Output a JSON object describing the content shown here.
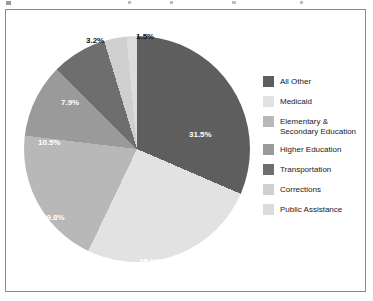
{
  "chart_data": {
    "type": "pie",
    "title": "",
    "subtitle": "",
    "xlabel": "",
    "ylabel": "",
    "legend_position": "right",
    "grid": false,
    "start_angle_deg": 0,
    "direction": "clockwise",
    "categories": [
      "All Other",
      "Medicaid",
      "Elementary & Secondary Education",
      "Higher Education",
      "Transportation",
      "Corrections",
      "Public Assistance"
    ],
    "values": [
      31.5,
      25.6,
      19.8,
      10.5,
      7.9,
      3.2,
      1.5
    ],
    "value_labels": [
      "31.5%",
      "25.6%",
      "19.8%",
      "10.5%",
      "7.9%",
      "3.2%",
      "1.5%"
    ],
    "units": "percent",
    "colors": [
      "#5e5e5e",
      "#e2e2e2",
      "#b8b8b8",
      "#9a9a9a",
      "#6e6e6e",
      "#cfcfcf",
      "#dcdcdc"
    ],
    "slices": [
      {
        "label": "All Other",
        "value": 31.5,
        "display": "31.5%",
        "color": "#5e5e5e",
        "label_color": "white"
      },
      {
        "label": "Medicaid",
        "value": 25.6,
        "display": "25.6%",
        "color": "#e2e2e2",
        "label_color": "white"
      },
      {
        "label": "Elementary & Secondary Education",
        "value": 19.8,
        "display": "19.8%",
        "color": "#b8b8b8",
        "label_color": "white"
      },
      {
        "label": "Higher Education",
        "value": 10.5,
        "display": "10.5%",
        "color": "#9a9a9a",
        "label_color": "white"
      },
      {
        "label": "Transportation",
        "value": 7.9,
        "display": "7.9%",
        "color": "#6e6e6e",
        "label_color": "white"
      },
      {
        "label": "Corrections",
        "value": 3.2,
        "display": "3.2%",
        "color": "#cfcfcf",
        "label_color": "black"
      },
      {
        "label": "Public Assistance",
        "value": 1.5,
        "display": "1.5%",
        "color": "#dcdcdc",
        "label_color": "black"
      }
    ]
  },
  "legend": {
    "items": [
      {
        "label": "All Other",
        "line1": "All Other",
        "line2": "",
        "color": "#5e5e5e"
      },
      {
        "label": "Medicaid",
        "line1": "Medicaid",
        "line2": "",
        "color": "#e2e2e2"
      },
      {
        "label": "Elementary & Secondary Education",
        "line1": "Elementary &",
        "line2": "Secondary Education",
        "color": "#b8b8b8"
      },
      {
        "label": "Higher Education",
        "line1": "Higher Education",
        "line2": "",
        "color": "#9a9a9a"
      },
      {
        "label": "Transportation",
        "line1": "Transportation",
        "line2": "",
        "color": "#6e6e6e"
      },
      {
        "label": "Corrections",
        "line1": "Corrections",
        "line2": "",
        "color": "#cfcfcf"
      },
      {
        "label": "Public Assistance",
        "line1": "Public Assistance",
        "line2": "",
        "color": "#dcdcdc"
      }
    ]
  }
}
